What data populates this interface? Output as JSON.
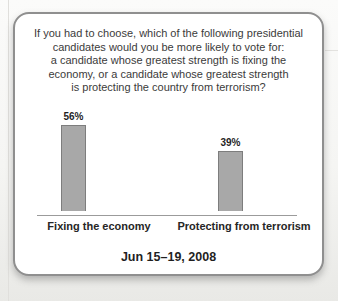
{
  "question": {
    "lines": [
      "If you had to choose, which of the following presidential",
      "candidates would you be more likely to vote for:",
      "a candidate whose greatest strength is fixing the",
      "economy, or a candidate whose greatest strength",
      "is protecting the country from terrorism?"
    ]
  },
  "chart_data": {
    "type": "bar",
    "categories": [
      "Fixing the economy",
      "Protecting from terrorism"
    ],
    "values": [
      56,
      39
    ],
    "value_labels": [
      "56%",
      "39%"
    ],
    "xlabel": "",
    "ylabel": "",
    "ylim": [
      0,
      60
    ],
    "grid": false,
    "legend": false,
    "annotation": "Jun 15–19, 2008",
    "bar_color": "#a8a8a8",
    "bar_border_color": "#7d7d7d",
    "px_per_unit": 1.54
  },
  "footer": {
    "date_label": "Jun 15–19, 2008"
  }
}
